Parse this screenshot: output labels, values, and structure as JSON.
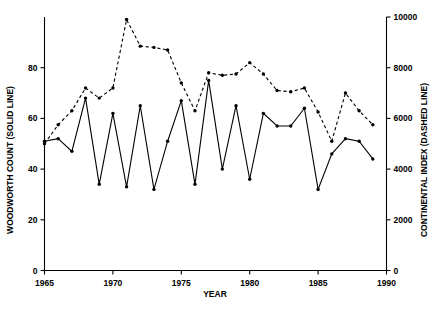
{
  "chart_data": {
    "type": "line",
    "title": "",
    "xlabel": "YEAR",
    "ylabel_left": "WOODWORTH COUNT (SOLID LINE)",
    "ylabel_right": "CONTINENTAL INDEX (DASHED LINE)",
    "xlim": [
      1965,
      1990
    ],
    "ylim_left": [
      0,
      100
    ],
    "ylim_right": [
      0,
      10000
    ],
    "xticks": [
      1965,
      1970,
      1975,
      1980,
      1985,
      1990
    ],
    "xticklabels": [
      "1965",
      "1970",
      "1975",
      "1980",
      "1985",
      "1990"
    ],
    "yticks_left": [
      0,
      20,
      40,
      60,
      80
    ],
    "yticklabels_left": [
      "0",
      "20",
      "40",
      "60",
      "80"
    ],
    "yticks_right": [
      0,
      2000,
      4000,
      6000,
      8000,
      10000
    ],
    "yticklabels_right": [
      "0",
      "2000",
      "4000",
      "6000",
      "8000",
      "10000"
    ],
    "grid": false,
    "legend": "none",
    "x": [
      1965,
      1966,
      1967,
      1968,
      1969,
      1970,
      1971,
      1972,
      1973,
      1974,
      1975,
      1976,
      1977,
      1978,
      1979,
      1980,
      1981,
      1982,
      1983,
      1984,
      1985,
      1986,
      1987,
      1988,
      1989
    ],
    "series": [
      {
        "name": "WOODWORTH COUNT (SOLID LINE)",
        "style": "solid",
        "marker": "filled-circle",
        "axis": "left",
        "values": [
          51,
          52,
          47,
          68,
          34,
          62,
          33,
          65,
          32,
          51,
          67,
          34,
          75,
          40,
          65,
          36,
          62,
          57,
          57,
          64,
          32,
          46,
          52,
          51,
          44
        ]
      },
      {
        "name": "CONTINENTAL INDEX (DASHED LINE)",
        "style": "dashed",
        "marker": "filled-circle",
        "axis": "right",
        "values": [
          5000,
          5750,
          6300,
          7200,
          6800,
          7200,
          9900,
          8850,
          8800,
          8700,
          7400,
          6300,
          7800,
          7700,
          7750,
          8200,
          7750,
          7100,
          7050,
          7200,
          6250,
          5100,
          7000,
          6300,
          5750
        ]
      }
    ]
  }
}
